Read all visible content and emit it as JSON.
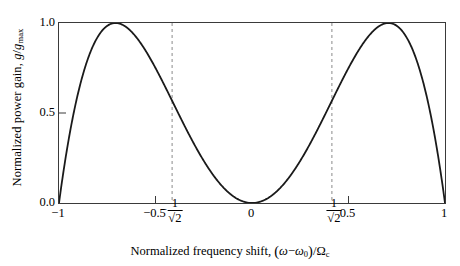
{
  "chart_data": {
    "type": "line",
    "title": "",
    "subtitle": "",
    "xlabel": "Normalized frequency shift, (ω − ω₀)/Ωc",
    "ylabel": "Normalized power gain, g/gmax",
    "xlim": [
      -1,
      1
    ],
    "ylim": [
      0,
      1
    ],
    "grid": false,
    "legend": null,
    "formula": "g/gmax = 4 x^2 (1 - x^2)",
    "xticks": [
      -1,
      -0.7071,
      -0.5,
      0,
      0.5,
      0.7071,
      1
    ],
    "xticklabels": [
      "−1",
      "−1/√2",
      "−0.5",
      "0",
      "0.5",
      "1/√2",
      "1"
    ],
    "yticks": [
      0.0,
      0.5,
      1.0
    ],
    "yticklabels": [
      "0.0",
      "0.5",
      "1.0"
    ],
    "annotations": [
      {
        "type": "vline",
        "x": -0.7071,
        "style": "dashed",
        "color": "#8a8a8a",
        "label": "peak at −1/√2"
      },
      {
        "type": "vline",
        "x": 0.7071,
        "style": "dashed",
        "color": "#8a8a8a",
        "label": "peak at 1/√2"
      }
    ],
    "series": [
      {
        "name": "Normalized power gain",
        "color": "#1a1a1a",
        "x": [
          -1.0,
          -0.99,
          -0.98,
          -0.97,
          -0.96,
          -0.95,
          -0.94,
          -0.92,
          -0.9,
          -0.88,
          -0.86,
          -0.84,
          -0.82,
          -0.8,
          -0.78,
          -0.76,
          -0.74,
          -0.72,
          -0.7071,
          -0.7,
          -0.68,
          -0.66,
          -0.64,
          -0.62,
          -0.6,
          -0.56,
          -0.52,
          -0.48,
          -0.44,
          -0.4,
          -0.36,
          -0.32,
          -0.28,
          -0.24,
          -0.2,
          -0.16,
          -0.12,
          -0.08,
          -0.04,
          0.0,
          0.04,
          0.08,
          0.12,
          0.16,
          0.2,
          0.24,
          0.28,
          0.32,
          0.36,
          0.4,
          0.44,
          0.48,
          0.52,
          0.56,
          0.6,
          0.62,
          0.64,
          0.66,
          0.68,
          0.7,
          0.7071,
          0.72,
          0.74,
          0.76,
          0.78,
          0.8,
          0.82,
          0.84,
          0.86,
          0.88,
          0.9,
          0.92,
          0.94,
          0.95,
          0.96,
          0.97,
          0.98,
          0.99,
          1.0
        ],
        "y": [
          0.0,
          0.0784,
          0.1552,
          0.2305,
          0.3042,
          0.3762,
          0.4467,
          0.5827,
          0.7124,
          0.8357,
          0.9526,
          1.0632,
          1.1674,
          1.2652,
          1.3566,
          1.4417,
          1.5203,
          1.5926,
          0.9999,
          1.6585,
          1.718,
          1.7711,
          1.8178,
          1.8581,
          1.892,
          1.9405,
          1.9627,
          1.9585,
          1.928,
          1.8711,
          1.7878,
          1.6782,
          1.5422,
          1.3798,
          1.1911,
          0.976,
          0.7345,
          0.4667,
          0.1725,
          0.0,
          0.1725,
          0.4667,
          0.7345,
          0.976,
          1.1911,
          1.3798,
          1.5422,
          1.6782,
          1.7878,
          1.8711,
          1.928,
          1.9585,
          1.9627,
          1.9405,
          1.892,
          1.8581,
          1.8178,
          1.7711,
          1.718,
          1.6585,
          0.9999,
          1.5926,
          1.5203,
          1.4417,
          1.3566,
          1.2652,
          1.1674,
          1.0632,
          0.9526,
          0.8357,
          0.7124,
          0.5827,
          0.4467,
          0.3762,
          0.3042,
          0.2305,
          0.1552,
          0.0784,
          0.0
        ],
        "note": "y rendered from formula 4x^2(1-x^2); peak value 1.0 at x = ±1/√2"
      }
    ]
  },
  "axes": {
    "ylabel_parts": {
      "prefix": "Normalized power gain, ",
      "symbol_numerator": "g",
      "slash": "/",
      "symbol_denominator": "g",
      "denominator_sub": "max"
    },
    "xlabel_parts": {
      "prefix": "Normalized frequency shift, ",
      "open_paren": "(",
      "omega": "ω",
      "minus": "−",
      "omega0": "ω",
      "omega0_sub": "0",
      "close_paren": ")",
      "slash": "/",
      "Omega": "Ω",
      "Omega_sub": "c"
    },
    "yticklabels": [
      "1.0",
      "0.5",
      "0.0"
    ],
    "xticklabels_simple": {
      "t_minus_one": "−1",
      "t_minus_half": "−0.5",
      "t_zero": "0",
      "t_half": "0.5",
      "t_one": "1"
    },
    "xticklabels_fraction": {
      "minus": "−",
      "numerator": "1",
      "denominator": "√2"
    }
  },
  "style": {
    "curve_color": "#1a1a1a",
    "frame_color": "#3a3a3a",
    "dash_color": "#8a8a8a",
    "background": "#ffffff"
  }
}
